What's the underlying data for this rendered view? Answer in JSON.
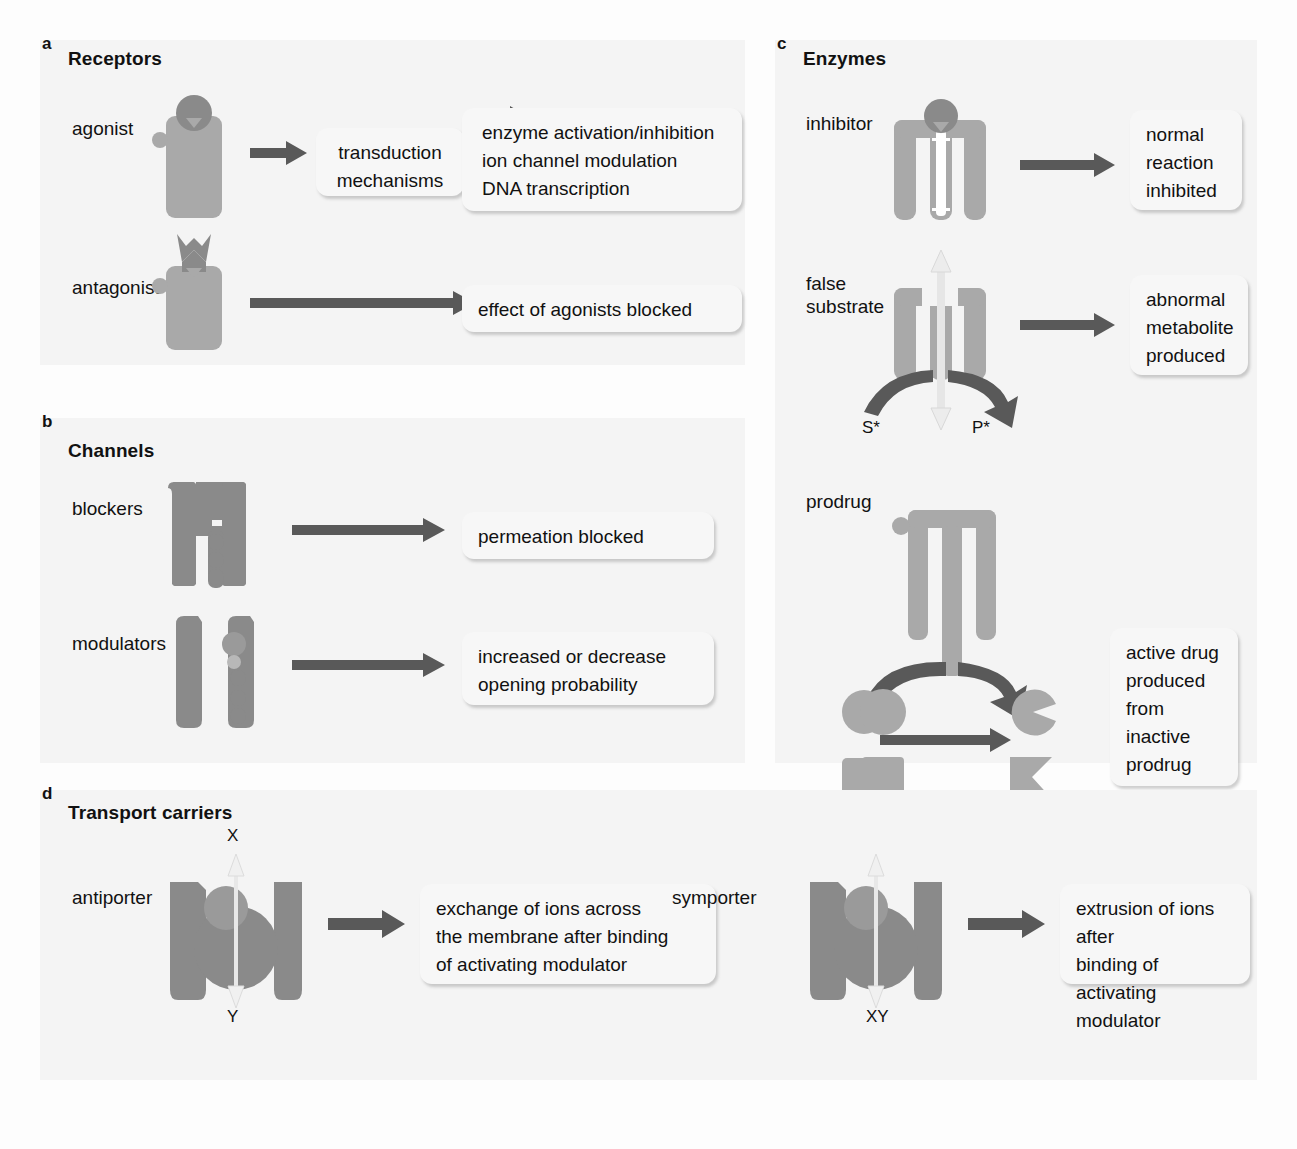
{
  "figure": {
    "background": "#fdfdfd",
    "panel_bg": "#f4f4f4",
    "shape_light": "#a9a9a9",
    "shape_dark": "#8a8a8a",
    "arrow_color": "#595959"
  },
  "panels": [
    {
      "letter": "a",
      "title": "Receptors",
      "rows": [
        {
          "label": "agonist",
          "callouts": [
            {
              "text": "transduction\nmechanisms"
            },
            {
              "text": "enzyme activation/inhibition\nion channel modulation\nDNA transcription"
            }
          ]
        },
        {
          "label": "antagonist",
          "callouts": [
            {
              "text": "effect of agonists blocked"
            }
          ]
        }
      ]
    },
    {
      "letter": "b",
      "title": "Channels",
      "rows": [
        {
          "label": "blockers",
          "callouts": [
            {
              "text": "permeation blocked"
            }
          ]
        },
        {
          "label": "modulators",
          "callouts": [
            {
              "text": "increased or decrease\nopening probability"
            }
          ]
        }
      ]
    },
    {
      "letter": "c",
      "title": "Enzymes",
      "rows": [
        {
          "label": "inhibitor",
          "callouts": [
            {
              "text": "normal\nreaction\ninhibited"
            }
          ]
        },
        {
          "label": "false\nsubstrate",
          "callouts": [
            {
              "text": "abnormal\nmetabolite\nproduced"
            }
          ],
          "annotations": [
            {
              "text": "S*"
            },
            {
              "text": "P*"
            }
          ]
        },
        {
          "label": "prodrug",
          "callouts": [
            {
              "text": "active drug\nproduced\nfrom\ninactive\nprodrug"
            }
          ]
        }
      ]
    },
    {
      "letter": "d",
      "title": "Transport carriers",
      "rows": [
        {
          "label": "antiporter",
          "callouts": [
            {
              "text": "exchange of ions across\nthe membrane after binding\nof activating modulator"
            }
          ],
          "annotations": [
            {
              "text": "X"
            },
            {
              "text": "Y"
            }
          ]
        },
        {
          "label": "symporter",
          "callouts": [
            {
              "text": "extrusion of ions after\nbinding of activating\nmodulator"
            }
          ],
          "annotations": [
            {
              "text": "XY"
            }
          ]
        }
      ]
    }
  ]
}
